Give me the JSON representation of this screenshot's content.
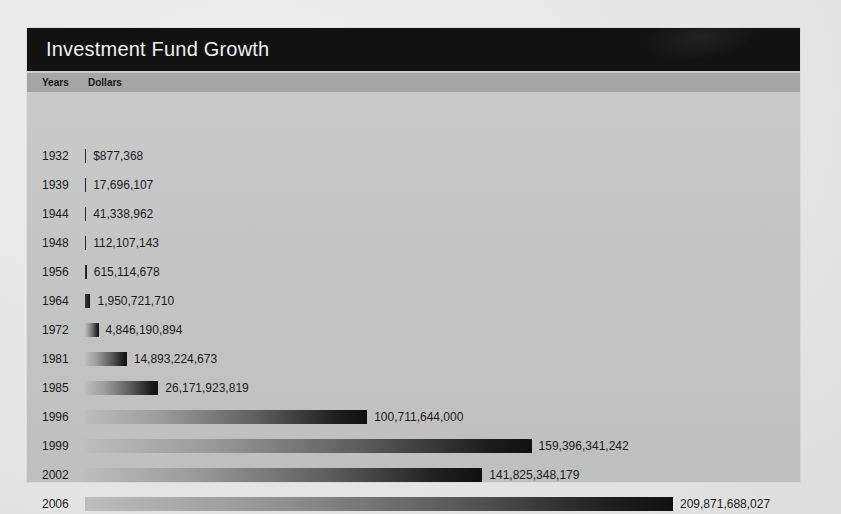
{
  "card": {
    "title": "Investment Fund Growth",
    "columns": {
      "years": "Years",
      "dollars": "Dollars"
    }
  },
  "chart_data": {
    "type": "bar",
    "title": "Investment Fund Growth",
    "xlabel": "Dollars",
    "ylabel": "Years",
    "orientation": "horizontal",
    "grid": false,
    "legend": false,
    "axis_max": 209871688027,
    "categories": [
      "1932",
      "1939",
      "1944",
      "1948",
      "1956",
      "1964",
      "1972",
      "1981",
      "1985",
      "1996",
      "1999",
      "2002",
      "2006"
    ],
    "values": [
      877368,
      17696107,
      41338962,
      112107143,
      615114678,
      1950721710,
      4846190894,
      14893224673,
      26171923819,
      100711644000,
      159396341242,
      141825348179,
      209871688027
    ],
    "value_labels": [
      "$877,368",
      "17,696,107",
      "41,338,962",
      "112,107,143",
      "615,114,678",
      "1,950,721,710",
      "4,846,190,894",
      "14,893,224,673",
      "26,171,923,819",
      "100,711,644,000",
      "159,396,341,242",
      "141,825,348,179",
      "209,871,688,027"
    ],
    "colors": {
      "bar_gradient_start": "#bdbdbd",
      "bar_gradient_end": "#101010",
      "title_bar": "#121212",
      "header_row": "#a5a5a5",
      "card_background": "#c5c5c5",
      "page_background": "#e9e9ea",
      "text": "#1b1b1f"
    }
  }
}
